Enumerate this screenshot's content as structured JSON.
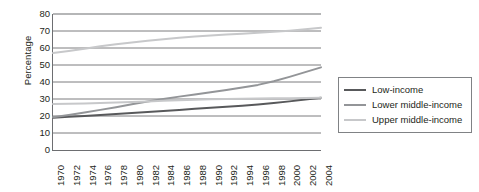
{
  "chart_data": {
    "type": "line",
    "title": "",
    "xlabel": "",
    "ylabel": "Percentage",
    "ylim": [
      0,
      80
    ],
    "ytick_step": 10,
    "yticks": [
      80,
      70,
      60,
      50,
      40,
      30,
      20,
      10,
      0
    ],
    "grid": true,
    "grid_axis": "y",
    "legend_position": "right",
    "x": [
      1970,
      1972,
      1974,
      1976,
      1978,
      1980,
      1982,
      1984,
      1986,
      1988,
      1990,
      1992,
      1994,
      1996,
      1998,
      2000,
      2002,
      2004
    ],
    "categories": [
      "1970",
      "1972",
      "1974",
      "1976",
      "1978",
      "1980",
      "1982",
      "1984",
      "1986",
      "1988",
      "1990",
      "1992",
      "1994",
      "1996",
      "1998",
      "2000",
      "2002",
      "2004"
    ],
    "series": [
      {
        "name": "Low-income",
        "color": "#58595b",
        "values": [
          19.0,
          19.5,
          20.0,
          20.6,
          21.2,
          21.8,
          22.4,
          23.0,
          23.6,
          24.2,
          24.8,
          25.4,
          26.0,
          26.7,
          27.6,
          28.6,
          29.7,
          30.8
        ]
      },
      {
        "name": "Lower middle-income",
        "color": "#939598",
        "values": [
          19.3,
          20.6,
          22.0,
          23.6,
          25.2,
          26.9,
          28.5,
          30.0,
          31.4,
          32.7,
          34.0,
          35.3,
          36.7,
          38.3,
          40.4,
          43.0,
          45.8,
          48.6
        ]
      },
      {
        "name": "Upper middle-income",
        "color": "#c7c8ca",
        "values": [
          57.0,
          58.2,
          59.6,
          61.0,
          62.2,
          63.3,
          64.3,
          65.2,
          66.0,
          66.7,
          67.3,
          67.9,
          68.4,
          68.9,
          69.5,
          70.2,
          71.0,
          71.9
        ]
      },
      {
        "name": "Upper middle-income lower band",
        "color": "#c7c8ca",
        "values": [
          27.0,
          27.2,
          27.4,
          27.6,
          27.9,
          28.2,
          28.5,
          28.9,
          29.2,
          29.5,
          29.8,
          30.0,
          30.2,
          30.3,
          30.4,
          30.5,
          30.6,
          30.7
        ]
      }
    ],
    "legend_entries": [
      {
        "label": "Low-income",
        "color": "#58595b"
      },
      {
        "label": "Lower middle-income",
        "color": "#939598"
      },
      {
        "label": "Upper middle-income",
        "color": "#c7c8ca"
      }
    ]
  }
}
